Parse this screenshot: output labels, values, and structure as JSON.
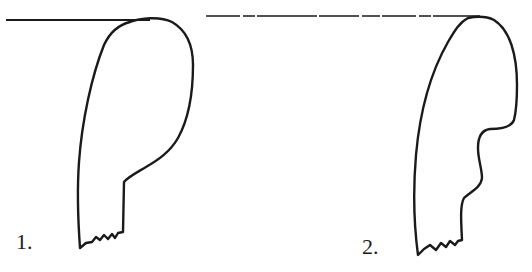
{
  "figure": {
    "stroke_color": "#1a1a1a",
    "background": "#ffffff",
    "profiles": [
      {
        "label": "1.",
        "rim_line": {
          "x1": 6,
          "y1": 20,
          "x2": 150,
          "y2": 20
        },
        "path": "M130,22 C140,18 160,16 172,22 C186,30 193,45 193,65 C193,95 188,120 178,138 C170,152 158,160 146,167 C136,173 128,177 124,182 L123,232 L118,233 L115,238 L112,234 L108,239 L104,235 L100,240 L96,237 L92,242 L86,243 L80,248 C78,220 77,190 79,162 C82,120 92,75 104,45 C110,32 118,25 130,22 Z"
      },
      {
        "label": "2.",
        "rim_line": {
          "x1": 206,
          "y1": 16,
          "x2": 480,
          "y2": 16
        },
        "path": "M468,18 C478,16 488,17 494,20 C510,30 517,55 517,85 C517,100 516,112 514,120 C511,128 500,129 490,129 C482,130 478,136 478,148 C478,160 482,168 482,178 C481,188 470,192 464,198 C460,205 461,220 462,240 L458,241 L455,245 L450,241 L446,247 L441,243 L436,250 L430,245 L424,249 L418,255 C414,225 413,190 416,155 C420,110 432,70 448,42 C455,30 460,22 468,18 Z"
      }
    ]
  }
}
